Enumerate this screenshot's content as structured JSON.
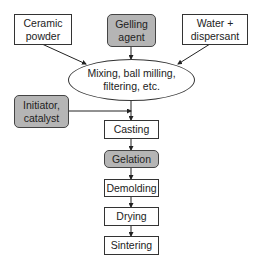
{
  "diagram": {
    "inputs": {
      "ceramic_powder": "Ceramic\npowder",
      "gelling_agent": "Gelling\nagent",
      "water_dispersant": "Water +\ndispersant",
      "initiator_catalyst": "Initiator,\ncatalyst"
    },
    "mixing": "Mixing, ball milling,\nfiltering, etc.",
    "steps": [
      "Casting",
      "Gelation",
      "Demolding",
      "Drying",
      "Sintering"
    ],
    "colors": {
      "highlight_fill": "#b5b5b5",
      "stroke": "#333333",
      "background": "#ffffff"
    }
  }
}
